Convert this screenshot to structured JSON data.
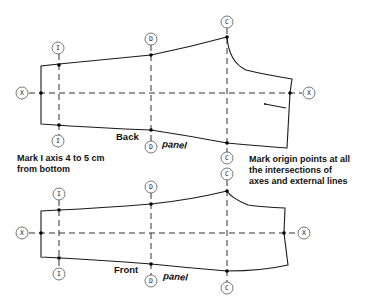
{
  "back_panel": {
    "label_word1": "Back",
    "label_word2": "panel",
    "markers": {
      "x_left": "X",
      "x_right": "X",
      "i_top": "I",
      "i_bottom": "I",
      "d_top": "D",
      "d_bottom": "D",
      "c_top": "C",
      "c_bottom": "C"
    }
  },
  "front_panel": {
    "label_word1": "Front",
    "label_word2": "panel",
    "markers": {
      "x_left": "X",
      "x_right": "X",
      "i_top": "I",
      "i_bottom": "I",
      "d_top": "D",
      "d_bottom": "D",
      "c_top": "C",
      "c_bottom": "C"
    }
  },
  "notes": {
    "left": [
      "Mark I axis 4 to 5 cm",
      "from bottom"
    ],
    "right": [
      "Mark origin points at all",
      "the intersections of",
      "axes and external lines"
    ]
  }
}
